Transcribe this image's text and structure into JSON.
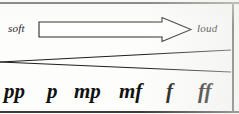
{
  "figure": {
    "ink_color": "#1c1c1a",
    "paper_color": "#fdfdfc"
  },
  "axis": {
    "soft_label": "soft",
    "loud_label": "loud",
    "arrow_direction": "right"
  },
  "dynamics": [
    {
      "symbol": "pp",
      "name": "pianissimo"
    },
    {
      "symbol": "p",
      "name": "piano"
    },
    {
      "symbol": "mp",
      "name": "mezzo piano"
    },
    {
      "symbol": "mf",
      "name": "mezzo forte"
    },
    {
      "symbol": "f",
      "name": "forte"
    },
    {
      "symbol": "ff",
      "name": "fortissimo"
    }
  ],
  "hairpin": {
    "type": "crescendo",
    "apex_side": "left",
    "open_side": "right"
  }
}
